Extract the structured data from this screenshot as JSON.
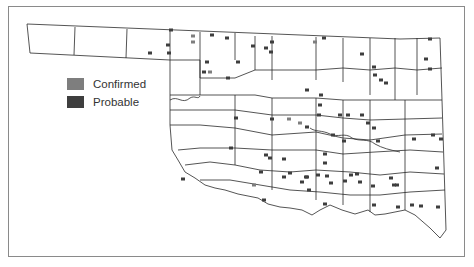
{
  "legend": {
    "items": [
      {
        "label": "Confirmed",
        "color": "#7e7e7e"
      },
      {
        "label": "Probable",
        "color": "#3e3e3e"
      }
    ]
  },
  "map": {
    "region": "Oklahoma counties",
    "border_color": "#2a2a2a",
    "markers": [
      {
        "x": 150,
        "y": 53,
        "type": "probable"
      },
      {
        "x": 168,
        "y": 45,
        "type": "probable"
      },
      {
        "x": 169,
        "y": 53,
        "type": "probable"
      },
      {
        "x": 171,
        "y": 30,
        "type": "probable"
      },
      {
        "x": 193,
        "y": 36,
        "type": "confirmed"
      },
      {
        "x": 193,
        "y": 42,
        "type": "confirmed"
      },
      {
        "x": 212,
        "y": 35,
        "type": "probable"
      },
      {
        "x": 227,
        "y": 38,
        "type": "probable"
      },
      {
        "x": 207,
        "y": 62,
        "type": "probable"
      },
      {
        "x": 204,
        "y": 72,
        "type": "probable"
      },
      {
        "x": 210,
        "y": 72,
        "type": "confirmed"
      },
      {
        "x": 228,
        "y": 78,
        "type": "probable"
      },
      {
        "x": 238,
        "y": 62,
        "type": "probable"
      },
      {
        "x": 253,
        "y": 46,
        "type": "probable"
      },
      {
        "x": 266,
        "y": 48,
        "type": "probable"
      },
      {
        "x": 272,
        "y": 42,
        "type": "probable"
      },
      {
        "x": 271,
        "y": 52,
        "type": "probable"
      },
      {
        "x": 315,
        "y": 42,
        "type": "confirmed"
      },
      {
        "x": 324,
        "y": 38,
        "type": "probable"
      },
      {
        "x": 362,
        "y": 54,
        "type": "probable"
      },
      {
        "x": 374,
        "y": 67,
        "type": "probable"
      },
      {
        "x": 375,
        "y": 75,
        "type": "probable"
      },
      {
        "x": 381,
        "y": 80,
        "type": "probable"
      },
      {
        "x": 386,
        "y": 83,
        "type": "probable"
      },
      {
        "x": 430,
        "y": 39,
        "type": "probable"
      },
      {
        "x": 426,
        "y": 59,
        "type": "probable"
      },
      {
        "x": 430,
        "y": 69,
        "type": "probable"
      },
      {
        "x": 307,
        "y": 90,
        "type": "probable"
      },
      {
        "x": 321,
        "y": 95,
        "type": "probable"
      },
      {
        "x": 320,
        "y": 105,
        "type": "probable"
      },
      {
        "x": 272,
        "y": 119,
        "type": "probable"
      },
      {
        "x": 289,
        "y": 119,
        "type": "confirmed"
      },
      {
        "x": 300,
        "y": 123,
        "type": "confirmed"
      },
      {
        "x": 307,
        "y": 127,
        "type": "probable"
      },
      {
        "x": 319,
        "y": 115,
        "type": "probable"
      },
      {
        "x": 340,
        "y": 115,
        "type": "probable"
      },
      {
        "x": 348,
        "y": 115,
        "type": "probable"
      },
      {
        "x": 362,
        "y": 115,
        "type": "probable"
      },
      {
        "x": 368,
        "y": 123,
        "type": "probable"
      },
      {
        "x": 374,
        "y": 128,
        "type": "probable"
      },
      {
        "x": 378,
        "y": 141,
        "type": "probable"
      },
      {
        "x": 236,
        "y": 118,
        "type": "probable"
      },
      {
        "x": 333,
        "y": 135,
        "type": "probable"
      },
      {
        "x": 344,
        "y": 141,
        "type": "probable"
      },
      {
        "x": 414,
        "y": 139,
        "type": "probable"
      },
      {
        "x": 433,
        "y": 135,
        "type": "probable"
      },
      {
        "x": 441,
        "y": 139,
        "type": "probable"
      },
      {
        "x": 231,
        "y": 148,
        "type": "probable"
      },
      {
        "x": 266,
        "y": 155,
        "type": "probable"
      },
      {
        "x": 270,
        "y": 158,
        "type": "probable"
      },
      {
        "x": 284,
        "y": 159,
        "type": "probable"
      },
      {
        "x": 325,
        "y": 154,
        "type": "probable"
      },
      {
        "x": 325,
        "y": 163,
        "type": "probable"
      },
      {
        "x": 261,
        "y": 172,
        "type": "probable"
      },
      {
        "x": 254,
        "y": 185,
        "type": "confirmed"
      },
      {
        "x": 290,
        "y": 173,
        "type": "probable"
      },
      {
        "x": 351,
        "y": 175,
        "type": "probable"
      },
      {
        "x": 373,
        "y": 186,
        "type": "probable"
      },
      {
        "x": 345,
        "y": 181,
        "type": "probable"
      },
      {
        "x": 437,
        "y": 168,
        "type": "probable"
      },
      {
        "x": 183,
        "y": 179,
        "type": "probable"
      },
      {
        "x": 264,
        "y": 200,
        "type": "probable"
      },
      {
        "x": 284,
        "y": 177,
        "type": "probable"
      },
      {
        "x": 302,
        "y": 182,
        "type": "probable"
      },
      {
        "x": 307,
        "y": 177,
        "type": "probable"
      },
      {
        "x": 318,
        "y": 175,
        "type": "probable"
      },
      {
        "x": 327,
        "y": 176,
        "type": "probable"
      },
      {
        "x": 331,
        "y": 183,
        "type": "probable"
      },
      {
        "x": 306,
        "y": 177,
        "type": "probable"
      },
      {
        "x": 357,
        "y": 174,
        "type": "probable"
      },
      {
        "x": 360,
        "y": 182,
        "type": "probable"
      },
      {
        "x": 391,
        "y": 178,
        "type": "probable"
      },
      {
        "x": 397,
        "y": 185,
        "type": "probable"
      },
      {
        "x": 309,
        "y": 190,
        "type": "probable"
      },
      {
        "x": 325,
        "y": 204,
        "type": "probable"
      },
      {
        "x": 374,
        "y": 205,
        "type": "probable"
      },
      {
        "x": 394,
        "y": 185,
        "type": "probable"
      },
      {
        "x": 398,
        "y": 207,
        "type": "probable"
      },
      {
        "x": 412,
        "y": 205,
        "type": "probable"
      },
      {
        "x": 421,
        "y": 206,
        "type": "probable"
      },
      {
        "x": 438,
        "y": 207,
        "type": "probable"
      }
    ]
  }
}
